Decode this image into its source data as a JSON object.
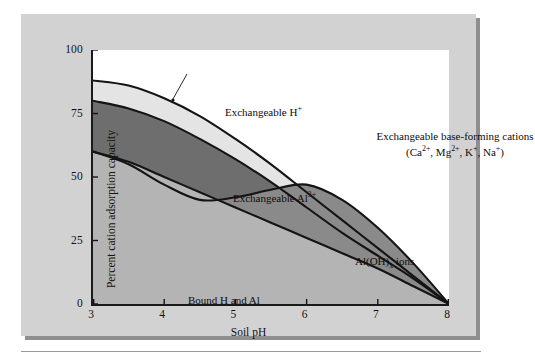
{
  "figure": {
    "background_color": "#d2d2d2",
    "plot_background_color": "#ffffff",
    "shadow_color": "#8f8f8f"
  },
  "chart_data": {
    "type": "area",
    "title": "",
    "subtitle": "",
    "xlabel": "Soil pH",
    "ylabel": "Percent cation adsorption capacity",
    "xlim": [
      3,
      8
    ],
    "ylim": [
      0,
      100
    ],
    "xticks": [
      3,
      4,
      5,
      6,
      7,
      8
    ],
    "yticks": [
      0,
      25,
      50,
      75,
      100
    ],
    "grid": false,
    "legend_position": "in-plot annotations",
    "stacking": "cumulative-from-zero",
    "x": [
      3.0,
      3.5,
      4.0,
      4.5,
      5.0,
      5.5,
      6.0,
      6.5,
      7.0,
      7.5,
      8.0
    ],
    "boundaries": [
      {
        "name": "Bound H and Al upper boundary",
        "fill_color": "#b4b4b4",
        "values": [
          60,
          56,
          50,
          44,
          38,
          32,
          26,
          20,
          14,
          7,
          0
        ]
      },
      {
        "name": "Al(OH)x ions upper boundary",
        "fill_color": "#8a8a8a",
        "values": [
          60,
          55,
          47,
          41,
          42,
          45,
          47,
          41,
          30,
          16,
          0
        ]
      },
      {
        "name": "Exchangeable Al3+ upper boundary",
        "fill_color": "#8a8a8a",
        "values": [
          80,
          77,
          72,
          65,
          57,
          48,
          38,
          28,
          19,
          10,
          0
        ]
      },
      {
        "name": "Exchangeable H+ upper boundary",
        "fill_color": "#e4e4e4",
        "values": [
          88,
          86,
          81,
          74,
          65,
          55,
          44,
          33,
          22,
          11,
          0
        ]
      }
    ],
    "bands": [
      {
        "name": "Bound H and Al",
        "label": "Bound H and Al",
        "fill_color": "#b4b4b4"
      },
      {
        "name": "Al(OH)x ions",
        "label": "Al(OH)x ions",
        "fill_color": "#8a8a8a"
      },
      {
        "name": "Exchangeable Al3+",
        "label": "Exchangeable Al3+",
        "fill_color": "#6e6e6e"
      },
      {
        "name": "Exchangeable H+",
        "label": "Exchangeable H+",
        "fill_color": "#e4e4e4"
      },
      {
        "name": "Exchangeable base-forming cations",
        "label": "Exchangeable base-forming cations",
        "fill_color": "#ffffff"
      }
    ],
    "annotations": [
      {
        "name": "exchangeable-h-plus",
        "text": "Exchangeable H",
        "sup": "+"
      },
      {
        "name": "base-forming-line1",
        "text": "Exchangeable base-forming cations"
      },
      {
        "name": "exchangeable-al3",
        "text": "Exchangeable Al",
        "sup": "3+"
      },
      {
        "name": "al-oh-x-ions",
        "text_pre": "Al(OH)",
        "sub": "x",
        "text_post": " ions"
      },
      {
        "name": "bound-h-and-al",
        "text": "Bound H and Al"
      }
    ]
  },
  "axes": {
    "y_title": "Percent cation adsorption capacity",
    "x_title": "Soil pH",
    "y_tick_labels": [
      "100",
      "75",
      "50",
      "25",
      "0"
    ],
    "x_tick_labels": [
      "3",
      "4",
      "5",
      "6",
      "7",
      "8"
    ]
  },
  "annotations": {
    "h_plus_label": "Exchangeable H",
    "h_plus_sup": "+",
    "base_forming_line1": "Exchangeable base-forming cations",
    "base_ca": "Ca",
    "base_ca_sup": "2+",
    "base_mg": "Mg",
    "base_mg_sup": "2+",
    "base_k": "K",
    "base_k_sup": "+",
    "base_na": "Na",
    "base_na_sup": "+",
    "al3_label": "Exchangeable Al",
    "al3_sup": "3+",
    "aloh_pre": "Al(OH)",
    "aloh_sub": "x",
    "aloh_post": " ions",
    "bound_label": "Bound H and Al"
  }
}
